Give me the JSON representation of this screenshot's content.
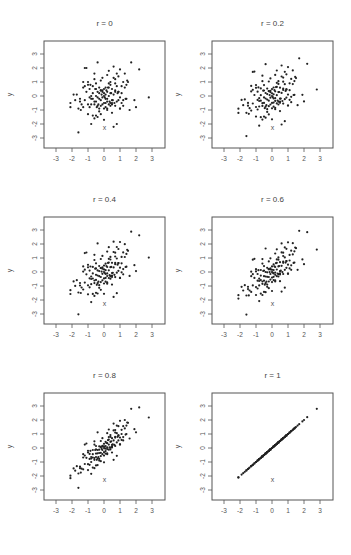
{
  "chart_data": {
    "type": "scatter",
    "layout": "3x2 grid of scatter plots",
    "xlabel": "x",
    "ylabel": "y",
    "xlim": [
      -3.8,
      3.8
    ],
    "ylim": [
      -3.8,
      3.8
    ],
    "xticks": [
      -3,
      -2,
      -1,
      0,
      1,
      2,
      3
    ],
    "yticks": [
      -3,
      -2,
      -1,
      0,
      1,
      2,
      3
    ],
    "grid": false,
    "legend": null,
    "panels": [
      {
        "title": "r = 0",
        "r": 0
      },
      {
        "title": "r = 0.2",
        "r": 0.2
      },
      {
        "title": "r = 0.4",
        "r": 0.4
      },
      {
        "title": "r = 0.6",
        "r": 0.6
      },
      {
        "title": "r = 0.8",
        "r": 0.8
      },
      {
        "title": "r = 1",
        "r": 1
      }
    ],
    "note": "Each panel shows the same ~150 standard-normal x values; y = r*x + sqrt(1-r^2)*z, with (x,z) read from the r = 0 panel.",
    "x": [
      -1.6,
      -2.1,
      -2.1,
      -1.8,
      -1.7,
      -1.6,
      -1.5,
      -1.4,
      -1.3,
      -1.3,
      -1.2,
      -1.2,
      -1.1,
      -1.1,
      -1.0,
      -1.0,
      -1.0,
      -0.9,
      -0.9,
      -0.8,
      -0.8,
      -0.8,
      -0.7,
      -0.7,
      -0.7,
      -0.6,
      -0.6,
      -0.6,
      -0.5,
      -0.5,
      -0.5,
      -0.5,
      -0.4,
      -0.4,
      -0.4,
      -0.4,
      -0.3,
      -0.3,
      -0.3,
      -0.3,
      -0.2,
      -0.2,
      -0.2,
      -0.2,
      -0.1,
      -0.1,
      -0.1,
      -0.1,
      0.0,
      0.0,
      0.0,
      0.0,
      0.1,
      0.1,
      0.1,
      0.1,
      0.2,
      0.2,
      0.2,
      0.2,
      0.3,
      0.3,
      0.3,
      0.3,
      0.4,
      0.4,
      0.4,
      0.4,
      0.5,
      0.5,
      0.5,
      0.6,
      0.6,
      0.6,
      0.7,
      0.7,
      0.7,
      0.8,
      0.8,
      0.8,
      0.9,
      0.9,
      1.0,
      1.0,
      1.0,
      1.1,
      1.1,
      1.2,
      1.2,
      1.3,
      1.3,
      1.4,
      1.4,
      1.5,
      1.6,
      1.7,
      1.9,
      2.0,
      2.2,
      2.8,
      -1.9,
      -1.5,
      -1.2,
      -0.9,
      -0.7,
      -0.5,
      -0.3,
      -0.1,
      0.1,
      0.3,
      0.5,
      0.7,
      0.9,
      1.1,
      -1.0,
      -0.6,
      -0.2,
      0.2,
      0.6,
      1.0,
      -0.8,
      -0.4,
      0.0,
      0.4,
      0.8,
      1.2,
      -1.3,
      0.0,
      0.5,
      -0.6,
      0.2,
      0.9,
      -0.2,
      0.7,
      -0.45,
      0.15,
      0.35,
      -0.15,
      0.05,
      0.25,
      -0.35,
      0.45,
      0.55,
      -0.55,
      1.35,
      1.45,
      -1.45,
      -0.85,
      0.65,
      0.85
    ],
    "z": [
      -2.6,
      -0.5,
      -0.8,
      -0.3,
      0.1,
      -0.9,
      -0.2,
      -0.6,
      0.6,
      -0.8,
      2.0,
      -0.3,
      2.0,
      0.3,
      1.0,
      -1.3,
      -0.6,
      0.5,
      -0.1,
      -0.6,
      0.0,
      -2.0,
      -1.4,
      0.7,
      0.2,
      -1.6,
      -0.6,
      1.6,
      -0.4,
      0.0,
      -1.4,
      0.5,
      -0.7,
      -0.1,
      0.3,
      2.4,
      -0.9,
      -0.2,
      0.2,
      0.6,
      -0.7,
      -0.3,
      0.4,
      1.1,
      -0.6,
      -0.1,
      0.3,
      1.3,
      -0.5,
      0.0,
      0.2,
      -1.7,
      -0.8,
      -0.2,
      0.1,
      0.6,
      -0.4,
      0.3,
      1.5,
      -0.9,
      -0.6,
      0.0,
      0.6,
      1.8,
      -0.5,
      0.2,
      0.8,
      1.0,
      -1.2,
      -0.3,
      0.5,
      -2.2,
      0.1,
      2.1,
      -0.7,
      0.4,
      1.2,
      -2.0,
      -0.4,
      1.6,
      0.3,
      1.4,
      -0.9,
      -0.1,
      1.9,
      -0.5,
      0.7,
      -0.7,
      1.0,
      0.6,
      1.6,
      -0.2,
      0.8,
      1.0,
      -1.0,
      2.4,
      -0.3,
      -0.8,
      1.9,
      -0.1,
      0.1,
      -0.4,
      0.7,
      -0.8,
      -0.2,
      0.9,
      -1.1,
      0.4,
      -0.5,
      0.9,
      -0.6,
      0.3,
      -0.3,
      0.2,
      0.8,
      -0.4,
      0.4,
      -1.0,
      1.3,
      -0.9,
      -0.2,
      -1.5,
      0.5,
      -0.7,
      0.7,
      -0.3,
      1.0,
      -0.9,
      -0.5,
      1.2,
      -0.2,
      0.3,
      -1.3,
      0.9,
      -0.8,
      0.4,
      -0.4,
      0.1,
      -0.1,
      0.6,
      -0.6,
      0.2,
      -0.3,
      0.5,
      -0.2,
      1.1,
      -1.0,
      0.8,
      -0.5,
      0.2,
      0.8
    ]
  }
}
